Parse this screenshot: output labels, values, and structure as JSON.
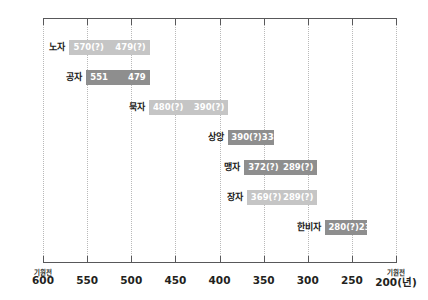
{
  "chart_data": {
    "type": "bar",
    "orientation": "horizontal-range",
    "title": "",
    "xlabel": "",
    "ylabel": "",
    "xlim": [
      600,
      200
    ],
    "x_axis_reversed": true,
    "x_prefix_left": "기원전",
    "x_prefix_right": "기원전",
    "x_unit_suffix": "(년)",
    "ticks": [
      {
        "value": 600,
        "label": "600",
        "prefix": "기원전"
      },
      {
        "value": 550,
        "label": "550",
        "prefix": ""
      },
      {
        "value": 500,
        "label": "500",
        "prefix": ""
      },
      {
        "value": 450,
        "label": "450",
        "prefix": ""
      },
      {
        "value": 400,
        "label": "400",
        "prefix": ""
      },
      {
        "value": 350,
        "label": "350",
        "prefix": ""
      },
      {
        "value": 300,
        "label": "300",
        "prefix": ""
      },
      {
        "value": 250,
        "label": "250",
        "prefix": ""
      },
      {
        "value": 200,
        "label": "200(년)",
        "prefix": "기원전"
      }
    ],
    "grid": true,
    "legend": "none",
    "categories": [
      "노자",
      "공자",
      "묵자",
      "상앙",
      "맹자",
      "장자",
      "한비자"
    ],
    "bars": [
      {
        "name": "노자",
        "start": 570,
        "end": 479,
        "start_label": "570(?)",
        "end_label": "479(?)",
        "color": "#c5c5c5",
        "shade": "light"
      },
      {
        "name": "공자",
        "start": 551,
        "end": 479,
        "start_label": "551",
        "end_label": "479",
        "color": "#8e8e8e",
        "shade": "dark"
      },
      {
        "name": "묵자",
        "start": 480,
        "end": 390,
        "start_label": "480(?)",
        "end_label": "390(?)",
        "color": "#c5c5c5",
        "shade": "light"
      },
      {
        "name": "상앙",
        "start": 390,
        "end": 338,
        "start_label": "390(?)",
        "end_label": "338",
        "color": "#8e8e8e",
        "shade": "dark"
      },
      {
        "name": "맹자",
        "start": 372,
        "end": 289,
        "start_label": "372(?)",
        "end_label": "289(?)",
        "color": "#8e8e8e",
        "shade": "dark"
      },
      {
        "name": "장자",
        "start": 369,
        "end": 289,
        "start_label": "369(?)",
        "end_label": "289(?)",
        "color": "#c5c5c5",
        "shade": "light"
      },
      {
        "name": "한비자",
        "start": 280,
        "end": 233,
        "start_label": "280(?)",
        "end_label": "233",
        "color": "#8e8e8e",
        "shade": "dark"
      }
    ]
  },
  "colors": {
    "bar_light": "#c5c5c5",
    "bar_dark": "#8e8e8e",
    "axis": "#58585a",
    "gridline": "#b9b9b9",
    "text": "#231f20",
    "bar_text": "#ffffff",
    "background": "#ffffff"
  }
}
